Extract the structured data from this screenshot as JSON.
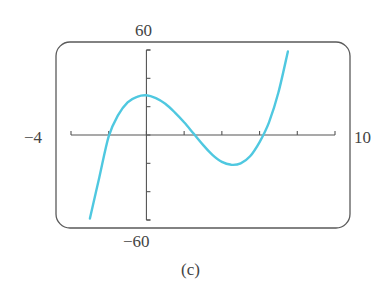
{
  "chart_data": {
    "type": "line",
    "title": "",
    "caption": "(c)",
    "xlabel": "",
    "ylabel": "",
    "xlim": [
      -4,
      10
    ],
    "ylim": [
      -60,
      60
    ],
    "x_tick_step": 2,
    "y_tick_step": 20,
    "window_labels": {
      "xmin": "-4",
      "xmax": "10",
      "ymin": "-60",
      "ymax": "60"
    },
    "grid": false,
    "legend": null,
    "series": [
      {
        "name": "f(x)",
        "color": "#4fc8e0",
        "x": [
          -3.0,
          -2.5,
          -2.0,
          -1.5,
          -1.0,
          -0.5,
          0.0,
          0.5,
          1.0,
          1.5,
          2.0,
          2.5,
          3.0,
          3.5,
          4.0,
          4.5,
          5.0,
          5.5,
          6.0,
          6.5,
          7.0,
          7.5
        ],
        "y": [
          -59,
          -30,
          -1,
          14,
          23,
          27,
          28,
          26,
          22,
          16,
          9,
          1,
          -7,
          -14,
          -19,
          -21,
          -20,
          -15,
          -5,
          9,
          30,
          59
        ]
      }
    ],
    "roots_approx": [
      -2.0,
      2.5,
      6.2
    ],
    "local_max_approx": {
      "x": 0.0,
      "y": 28
    },
    "local_min_approx": {
      "x": 4.6,
      "y": -21
    }
  },
  "labels": {
    "ymax": "60",
    "ymin": "−60",
    "xmin": "−4",
    "xmax": "10",
    "caption": "(c)"
  },
  "colors": {
    "curve": "#4fc8e0",
    "frame": "#555555",
    "axis": "#555555"
  }
}
